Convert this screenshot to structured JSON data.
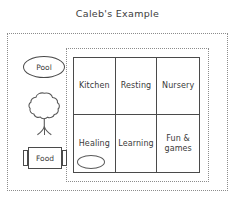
{
  "title": "Caleb's Example",
  "canvas": {
    "background_color": "#ffffff",
    "ink_color": "#4a4a4a",
    "dotted_border_color": "#8c8c8c"
  },
  "outer_area": {
    "name": "property-boundary",
    "border_style": "dotted"
  },
  "building_area": {
    "name": "building-boundary",
    "border_style": "dotted"
  },
  "grid": {
    "columns": 3,
    "rows": 2,
    "cells": [
      {
        "id": "cell-kitchen",
        "label": "Kitchen",
        "row": 1,
        "col": 1
      },
      {
        "id": "cell-resting",
        "label": "Resting",
        "row": 1,
        "col": 2
      },
      {
        "id": "cell-nursery",
        "label": "Nursery",
        "row": 1,
        "col": 3
      },
      {
        "id": "cell-healing",
        "label": "Healing",
        "row": 2,
        "col": 1
      },
      {
        "id": "cell-learning",
        "label": "Learning",
        "row": 2,
        "col": 2
      },
      {
        "id": "cell-fun",
        "label": "Fun &\ngames",
        "row": 2,
        "col": 3
      }
    ],
    "decorations": [
      {
        "id": "healing-oval",
        "shape": "oval",
        "in_cell": "cell-healing"
      }
    ]
  },
  "yard_objects": [
    {
      "id": "pool",
      "label": "Pool",
      "shape": "oval"
    },
    {
      "id": "tree",
      "label": "",
      "shape": "tree"
    },
    {
      "id": "food",
      "label": "Food",
      "shape": "box-with-tabs"
    }
  ]
}
